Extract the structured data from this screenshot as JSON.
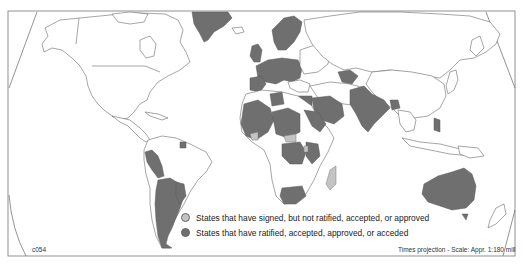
{
  "map": {
    "projection_note": "Times projection - Scale: Appr. 1:180 mill",
    "map_code": "c054",
    "colors": {
      "ratified": "#6f6f6f",
      "signed": "#c4c4c4",
      "other": "#ffffff",
      "border": "#6a6a6a"
    }
  },
  "legend": {
    "items": [
      {
        "label": "States that have signed, but not ratified, accepted, or approved",
        "color": "#c4c4c4",
        "key": "signed"
      },
      {
        "label": "States that have ratified, accepted, approved, or acceded",
        "color": "#6f6f6f",
        "key": "ratified"
      }
    ]
  },
  "regions": {
    "ratified": [
      "Greenland",
      "Western Europe",
      "Scandinavia",
      "Iberia",
      "West Africa",
      "Sahel",
      "Egypt",
      "Saudi Arabia",
      "Central Africa",
      "East Africa",
      "South Africa",
      "India",
      "Pakistan",
      "Central Asia",
      "Bangladesh",
      "Philippines",
      "Peru",
      "Argentina",
      "Chile",
      "Paraguay",
      "Uruguay",
      "Australia",
      "Tasmania"
    ],
    "signed": [
      "Madagascar",
      "West African coast state",
      "Central African state"
    ]
  }
}
